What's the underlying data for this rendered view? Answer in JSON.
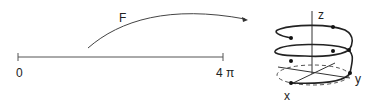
{
  "interval": {
    "start_label": "0",
    "end_label": "4 π"
  },
  "map": {
    "label": "F"
  },
  "axes": {
    "x": "x",
    "y": "y",
    "z": "z"
  },
  "colors": {
    "stroke": "#333333",
    "background": "#ffffff"
  }
}
